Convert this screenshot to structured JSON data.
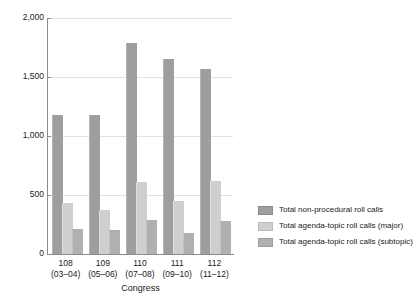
{
  "chart_data": {
    "type": "bar",
    "title": "",
    "subtitle": "",
    "xlabel": "Congress",
    "ylabel": "",
    "ylim": [
      0,
      2000
    ],
    "ytick_values": [
      0,
      500,
      1000,
      1500,
      2000
    ],
    "ytick_labels": [
      "0",
      "500",
      "1,000",
      "1,500",
      "2,000"
    ],
    "grid": true,
    "grid_axis": "y",
    "legend_position": "right",
    "categories": [
      "108",
      "109",
      "110",
      "111",
      "112"
    ],
    "category_sublabels": [
      "(03–04)",
      "(05–06)",
      "(07–08)",
      "(09–10)",
      "(11–12)"
    ],
    "series": [
      {
        "name": "Total non-procedural roll calls",
        "color": "#9e9e9e",
        "values": [
          1180,
          1180,
          1790,
          1650,
          1570
        ]
      },
      {
        "name": "Total agenda-topic roll calls (major)",
        "color": "#cfcfcf",
        "values": [
          430,
          370,
          610,
          450,
          620
        ]
      },
      {
        "name": "Total agenda-topic roll calls (subtopic)",
        "color": "#b0b0b0",
        "values": [
          210,
          200,
          290,
          180,
          280
        ]
      }
    ]
  }
}
